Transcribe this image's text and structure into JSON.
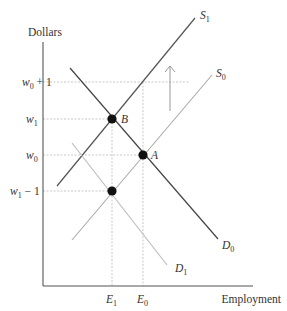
{
  "axes": {
    "y_label": "Dollars",
    "x_label": "Employment"
  },
  "y_ticks": [
    {
      "id": "w0_plus_1",
      "base": "w",
      "sub": "0",
      "suffix": " + 1",
      "y": 82
    },
    {
      "id": "w1",
      "base": "w",
      "sub": "1",
      "suffix": "",
      "y": 119
    },
    {
      "id": "w0",
      "base": "w",
      "sub": "0",
      "suffix": "",
      "y": 155
    },
    {
      "id": "w1_minus_1",
      "base": "w",
      "sub": "1",
      "suffix": " − 1",
      "y": 191
    }
  ],
  "x_ticks": [
    {
      "id": "E1",
      "base": "E",
      "sub": "1",
      "x": 112
    },
    {
      "id": "E0",
      "base": "E",
      "sub": "0",
      "x": 143
    }
  ],
  "curves": {
    "S1": {
      "base": "S",
      "sub": "1",
      "color": "#555555"
    },
    "S0": {
      "base": "S",
      "sub": "0",
      "color": "#aaaaaa"
    },
    "D0": {
      "base": "D",
      "sub": "0",
      "color": "#444444"
    },
    "D1": {
      "base": "D",
      "sub": "1",
      "color": "#bbbbbb"
    }
  },
  "points": {
    "A": "A",
    "B": "B"
  },
  "colors": {
    "axis": "#555555",
    "guide": "#bbbbbb",
    "dot": "#111111",
    "arrow": "#999999"
  }
}
